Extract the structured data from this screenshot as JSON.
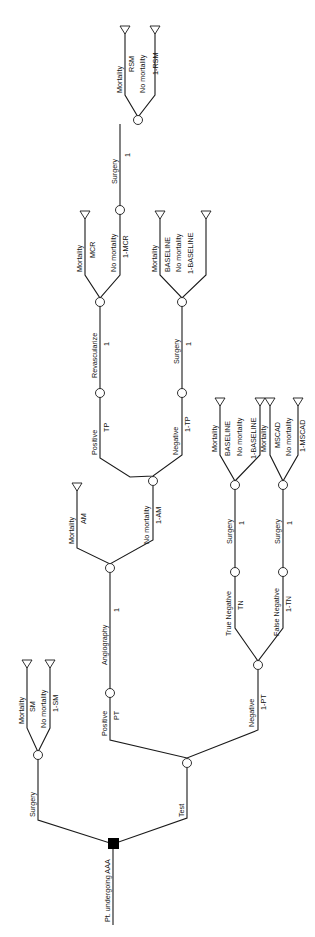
{
  "diagram": {
    "type": "decision-tree",
    "orientation": "rotated-90-ccw",
    "root": {
      "label": "Pt. undergoing AAA",
      "node": "decision"
    },
    "branches": {
      "surgery": {
        "label": "Surgery",
        "outcomes": [
          {
            "label": "Mortality",
            "prob": "SM"
          },
          {
            "label": "No mortality",
            "prob": "1-SM"
          }
        ]
      },
      "test": {
        "label": "Test",
        "positive": {
          "label": "Positive",
          "prob": "PT",
          "angiography": {
            "label": "Angiography",
            "prob": "1",
            "mortality": {
              "label": "Mortality",
              "prob": "AM"
            },
            "no_mortality": {
              "label": "No mortality",
              "prob": "1-AM",
              "positive": {
                "label": "Positive",
                "prob": "TP",
                "revascularize": {
                  "label": "Revascularize",
                  "prob": "1",
                  "mortality": {
                    "label": "Mortality",
                    "prob": "MCR"
                  },
                  "no_mortality": {
                    "label": "No mortality",
                    "prob": "1-MCR",
                    "surgery": {
                      "label": "Surgery",
                      "prob": "1",
                      "mortality": {
                        "label": "Mortality",
                        "prob": "RSM"
                      },
                      "no_mortality": {
                        "label": "No mortality",
                        "prob": "1-RSM"
                      }
                    }
                  }
                }
              },
              "negative": {
                "label": "Negative",
                "prob": "1-TP",
                "surgery": {
                  "label": "Surgery",
                  "prob": "1",
                  "mortality": {
                    "label": "Mortality",
                    "prob": "BASELINE"
                  },
                  "no_mortality": {
                    "label": "No mortality",
                    "prob": "1-BASELINE"
                  }
                }
              }
            }
          }
        },
        "negative": {
          "label": "Negative",
          "prob": "1-PT",
          "true_negative": {
            "label": "True Negative",
            "prob": "TN",
            "surgery": {
              "label": "Surgery",
              "prob": "1",
              "mortality": {
                "label": "Mortality",
                "prob": "BASELINE"
              },
              "no_mortality": {
                "label": "No mortality",
                "prob": "1-BASELINE"
              }
            }
          },
          "false_negative": {
            "label": "False Negative",
            "prob": "1-TN",
            "surgery": {
              "label": "Surgery",
              "prob": "1",
              "mortality": {
                "label": "Mortality",
                "prob": "MSCAD"
              },
              "no_mortality": {
                "label": "No mortality",
                "prob": "1-MSCAD"
              }
            }
          }
        }
      }
    }
  }
}
